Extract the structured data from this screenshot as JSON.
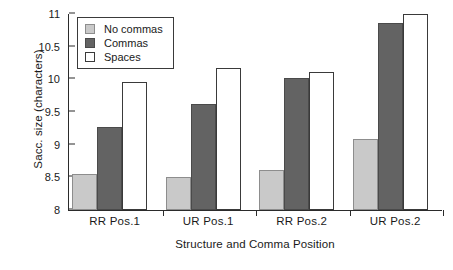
{
  "chart_data": {
    "type": "bar",
    "title": "",
    "xlabel": "Structure and Comma Position",
    "ylabel": "Sacc. size (characters)",
    "categories": [
      "RR Pos.1",
      "UR Pos.1",
      "RR Pos.2",
      "UR Pos.2"
    ],
    "series": [
      {
        "name": "No commas",
        "color": "#c9c9c9",
        "values": [
          8.55,
          8.51,
          8.61,
          9.09
        ]
      },
      {
        "name": "Commas",
        "color": "#636363",
        "values": [
          9.27,
          9.62,
          10.02,
          10.87
        ]
      },
      {
        "name": "Spaces",
        "color": "#ffffff",
        "values": [
          9.96,
          10.17,
          10.11,
          11.0
        ]
      }
    ],
    "ylim": [
      8,
      11
    ],
    "ytick_labels": [
      "11",
      "10.5",
      "10",
      "9.5",
      "9",
      "8.5",
      "8"
    ],
    "ytick_values": [
      11,
      10.5,
      10,
      9.5,
      9,
      8.5,
      8
    ],
    "grid": false,
    "legend_position": "top-left"
  }
}
